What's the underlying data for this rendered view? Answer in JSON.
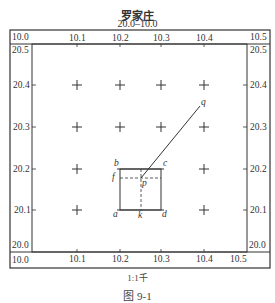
{
  "sheet": {
    "title": "罗家庄",
    "sheet_number": "20.0–10.0",
    "scale": "1:1千",
    "figure_caption": "图 9-1"
  },
  "corners": {
    "top_left_x": "10.0",
    "top_left_y": "20.5",
    "top_right_x": "10.5",
    "top_right_y": "20.5",
    "bottom_left_y": "20.0",
    "bottom_left_x": "10.0",
    "bottom_right_y": "20.0"
  },
  "axes": {
    "top_x_ticks": [
      "10.1",
      "10.2",
      "10.3",
      "10.4"
    ],
    "bottom_x_ticks": [
      "10.1",
      "10.2",
      "10.3",
      "10.4",
      "10.5"
    ],
    "left_y_ticks": [
      "20.4",
      "20.3",
      "20.2",
      "20.1"
    ],
    "right_y_ticks": [
      "20.4",
      "20.3",
      "20.2",
      "20.1"
    ]
  },
  "points": {
    "a": "a",
    "b": "b",
    "c": "c",
    "d": "d",
    "f": "f",
    "k": "k",
    "p": "p",
    "q": "q"
  },
  "colors": {
    "line": "#333333",
    "background": "#ffffff"
  }
}
